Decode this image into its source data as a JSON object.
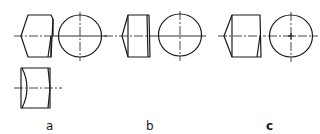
{
  "figure": {
    "panels": [
      {
        "id": "a",
        "label": "a",
        "views": [
          "side-view-chamfered-blank",
          "end-view-circle",
          "side-view-concave-blank"
        ]
      },
      {
        "id": "b",
        "label": "b",
        "views": [
          "side-view-chamfered-blank",
          "end-view-circle"
        ]
      },
      {
        "id": "c",
        "label": "c",
        "views": [
          "side-view-chamfered-blank",
          "end-view-circle-with-center-mark"
        ]
      }
    ],
    "colors": {
      "line": "#1a1a1a",
      "background": "#ffffff"
    }
  }
}
